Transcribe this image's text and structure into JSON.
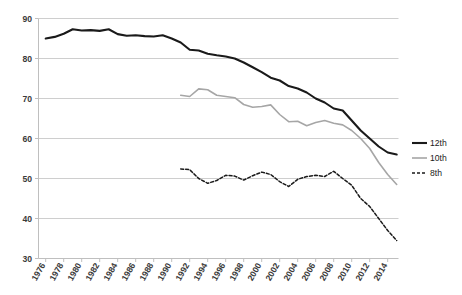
{
  "chart_data": {
    "type": "line",
    "title": "",
    "xlabel": "",
    "ylabel": "",
    "xlim": [
      1975.2,
      2015.2
    ],
    "ylim": [
      30,
      90
    ],
    "ytick_labels": [
      "30",
      "40",
      "50",
      "60",
      "70",
      "80",
      "90"
    ],
    "yticks": [
      30,
      40,
      50,
      60,
      70,
      80,
      90
    ],
    "xtick_labels": [
      "1976",
      "1978",
      "1980",
      "1982",
      "1984",
      "1986",
      "1988",
      "1990",
      "1992",
      "1994",
      "1996",
      "1998",
      "2000",
      "2002",
      "2004",
      "2006",
      "2008",
      "2010",
      "2012",
      "2014"
    ],
    "xticks": [
      1976,
      1978,
      1980,
      1982,
      1984,
      1986,
      1988,
      1990,
      1992,
      1994,
      1996,
      1998,
      2000,
      2002,
      2004,
      2006,
      2008,
      2010,
      2012,
      2014
    ],
    "grid": "horizontal",
    "legend_position": "right",
    "series": [
      {
        "name": "12th",
        "color": "#1a1a1a",
        "width": 2.1,
        "dash": "none",
        "x": [
          1976,
          1977,
          1978,
          1979,
          1980,
          1981,
          1982,
          1983,
          1984,
          1985,
          1986,
          1987,
          1988,
          1989,
          1990,
          1991,
          1992,
          1993,
          1994,
          1995,
          1996,
          1997,
          1998,
          1999,
          2000,
          2001,
          2002,
          2003,
          2004,
          2005,
          2006,
          2007,
          2008,
          2009,
          2010,
          2011,
          2012,
          2013,
          2014,
          2015
        ],
        "values": [
          85.0,
          85.4,
          86.2,
          87.3,
          87.0,
          87.1,
          86.9,
          87.3,
          86.1,
          85.7,
          85.8,
          85.6,
          85.5,
          85.8,
          85.0,
          84.0,
          82.2,
          82.0,
          81.2,
          80.8,
          80.5,
          80.0,
          79.0,
          77.8,
          76.6,
          75.2,
          74.5,
          73.1,
          72.5,
          71.5,
          70.0,
          69.0,
          67.5,
          67.0,
          64.5,
          62.0,
          60.0,
          58.0,
          56.5,
          56.0
        ]
      },
      {
        "name": "10th",
        "color": "#a6a6a6",
        "width": 1.6,
        "dash": "none",
        "x": [
          1991,
          1992,
          1993,
          1994,
          1995,
          1996,
          1997,
          1998,
          1999,
          2000,
          2001,
          2002,
          2003,
          2004,
          2005,
          2006,
          2007,
          2008,
          2009,
          2010,
          2011,
          2012,
          2013,
          2014,
          2015
        ],
        "values": [
          70.8,
          70.5,
          72.4,
          72.2,
          70.8,
          70.5,
          70.2,
          68.5,
          67.8,
          68.0,
          68.4,
          66.0,
          64.2,
          64.3,
          63.2,
          64.0,
          64.5,
          63.8,
          63.4,
          62.0,
          60.0,
          57.5,
          54.0,
          51.0,
          48.5
        ]
      },
      {
        "name": "8th",
        "color": "#1a1a1a",
        "width": 1.5,
        "dash": "3,2",
        "x": [
          1991,
          1992,
          1993,
          1994,
          1995,
          1996,
          1997,
          1998,
          1999,
          2000,
          2001,
          2002,
          2003,
          2004,
          2005,
          2006,
          2007,
          2008,
          2009,
          2010,
          2011,
          2012,
          2013,
          2014,
          2015
        ],
        "values": [
          52.4,
          52.2,
          50.0,
          48.8,
          49.5,
          50.8,
          50.6,
          49.6,
          50.7,
          51.6,
          51.0,
          49.2,
          48.0,
          49.8,
          50.5,
          50.8,
          50.5,
          51.8,
          50.0,
          48.3,
          45.0,
          43.0,
          40.0,
          37.0,
          34.5
        ]
      }
    ],
    "legend": [
      {
        "label": "12th",
        "color": "#1a1a1a",
        "dash": "none",
        "width": 2.1
      },
      {
        "label": "10th",
        "color": "#a6a6a6",
        "dash": "none",
        "width": 1.6
      },
      {
        "label": "8th",
        "color": "#1a1a1a",
        "dash": "3,2",
        "width": 1.5
      }
    ]
  },
  "axis": {
    "tick_color": "#bfbfbf",
    "grid_color": "#c8c8c8",
    "label_color": "#3a3a3a"
  }
}
